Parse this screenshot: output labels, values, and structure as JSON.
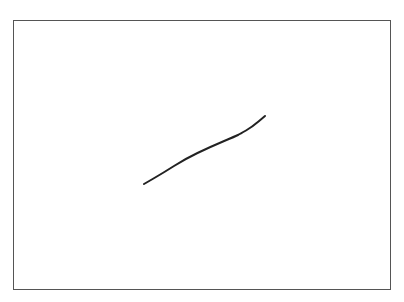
{
  "canvas": {
    "width": 404,
    "height": 302,
    "background": "#ffffff",
    "frame": {
      "x": 13,
      "y": 20,
      "width": 378,
      "height": 270,
      "border_color": "#555555"
    }
  },
  "drawing": {
    "stroke_color": "#222222",
    "stroke_width": 2,
    "points": [
      [
        144,
        184
      ],
      [
        163,
        173
      ],
      [
        185,
        159
      ],
      [
        210,
        147
      ],
      [
        236,
        136
      ],
      [
        240,
        134
      ],
      [
        252,
        127
      ],
      [
        265,
        116
      ]
    ]
  }
}
